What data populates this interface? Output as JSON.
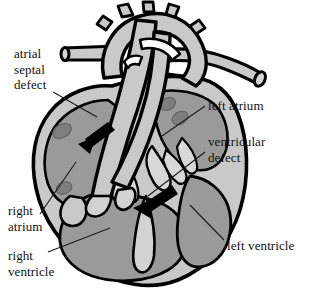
{
  "figure": {
    "background_color": "#ffffff",
    "width": 312,
    "height": 297
  },
  "colors": {
    "outline": "#000000",
    "vessel_fill": "#c9c9c9",
    "myocardium_fill": "#c9c9c9",
    "chamber_fill": "#9a9a9a",
    "muscle_spot_fill": "#7e7e7e",
    "arrow_fill": "#000000",
    "leader_line": "#1a1a1a",
    "text": "#111111"
  },
  "labels": [
    {
      "id": "atrial-septal-defect",
      "text": "atrial\nseptal\ndefect",
      "position": "left-top"
    },
    {
      "id": "left-atrium",
      "text": "left atrium",
      "position": "right-top"
    },
    {
      "id": "ventricular-defect",
      "text": "ventricular\ndefect",
      "position": "right-middle"
    },
    {
      "id": "right-atrium",
      "text": "right\natrium",
      "position": "left-bottom"
    },
    {
      "id": "right-ventricle",
      "text": "right\nventricle",
      "position": "left-bottom-lower"
    },
    {
      "id": "left-ventricle",
      "text": "left ventricle",
      "position": "right-bottom"
    }
  ],
  "annotations": {
    "flow_arrows": [
      {
        "id": "atrial-shunt-arrow",
        "description": "blood flow arrow through atrial septal defect",
        "direction": "down-left"
      },
      {
        "id": "ventricular-shunt-arrow",
        "description": "blood flow arrow through ventricular septal defect",
        "direction": "down-left"
      }
    ]
  }
}
